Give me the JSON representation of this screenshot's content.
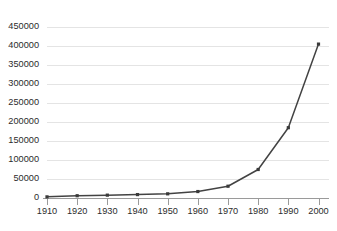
{
  "chart_data": {
    "type": "line",
    "title": "",
    "subtitle": "",
    "xlabel": "",
    "ylabel": "",
    "categories": [
      "1910",
      "1920",
      "1930",
      "1940",
      "1950",
      "1960",
      "1970",
      "1980",
      "1990",
      "2000"
    ],
    "x": [
      1910,
      1920,
      1930,
      1940,
      1950,
      1960,
      1970,
      1980,
      1990,
      2000
    ],
    "values": [
      3000,
      6000,
      7500,
      9000,
      11000,
      17000,
      31000,
      75000,
      185000,
      405000
    ],
    "series": [
      {
        "name": "",
        "values": [
          3000,
          6000,
          7500,
          9000,
          11000,
          17000,
          31000,
          75000,
          185000,
          405000
        ]
      }
    ],
    "ylim": [
      0,
      450000
    ],
    "xlim": [
      1910,
      2000
    ],
    "ytick_labels": [
      "0",
      "50000",
      "100000",
      "150000",
      "200000",
      "250000",
      "300000",
      "350000",
      "400000",
      "450000"
    ],
    "ytick_values": [
      0,
      50000,
      100000,
      150000,
      200000,
      250000,
      300000,
      350000,
      400000,
      450000
    ],
    "xtick_labels": [
      "1910",
      "1920",
      "1930",
      "1940",
      "1950",
      "1960",
      "1970",
      "1980",
      "1990",
      "2000"
    ],
    "grid": true,
    "grid_axis": "y",
    "legend": false,
    "legend_position": "none",
    "marker": "square",
    "line_color": "#434343",
    "marker_color": "#3a3a3a",
    "grid_color": "#e4e4e4",
    "axis_color": "#9a9a9a",
    "background_color": "#ffffff",
    "annotations": []
  },
  "caption": {
    "text": ""
  }
}
